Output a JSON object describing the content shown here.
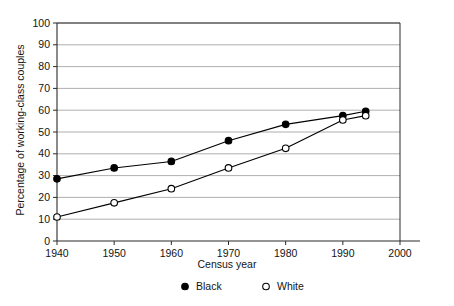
{
  "chart_data": {
    "type": "line",
    "title": "",
    "subtitle": "",
    "xlabel": "Census year",
    "ylabel": "Percentage of working-class couples",
    "x": [
      1940,
      1950,
      1960,
      1970,
      1980,
      1990,
      1994
    ],
    "xlim": [
      1940,
      2000
    ],
    "ylim": [
      0,
      100
    ],
    "xticks": [
      1940,
      1950,
      1960,
      1970,
      1980,
      1990,
      2000
    ],
    "xtick_labels": [
      "1940",
      "1950",
      "1960",
      "1970",
      "1980",
      "1990",
      "2000"
    ],
    "yticks": [
      0,
      10,
      20,
      30,
      40,
      50,
      60,
      70,
      80,
      90,
      100
    ],
    "ytick_labels": [
      "0",
      "10",
      "20",
      "30",
      "40",
      "50",
      "60",
      "70",
      "80",
      "90",
      "100"
    ],
    "grid": "horizontal",
    "legend_position": "below",
    "series": [
      {
        "name": "Black",
        "marker": "filled-circle",
        "color": "#000000",
        "values": [
          28.5,
          33.5,
          36.5,
          46.0,
          53.5,
          57.5,
          59.5
        ]
      },
      {
        "name": "White",
        "marker": "open-circle",
        "color": "#000000",
        "values": [
          11.0,
          17.5,
          24.0,
          33.5,
          42.5,
          55.5,
          57.5
        ]
      }
    ],
    "annotations": []
  },
  "legend": {
    "items": [
      {
        "label": "Black",
        "marker": "filled-circle"
      },
      {
        "label": "White",
        "marker": "open-circle"
      }
    ]
  },
  "colors": {
    "line": "#000000",
    "grid": "#9a9a9a",
    "axis": "#2b2b2b",
    "background": "#ffffff",
    "marker_fill_open": "#ffffff"
  }
}
